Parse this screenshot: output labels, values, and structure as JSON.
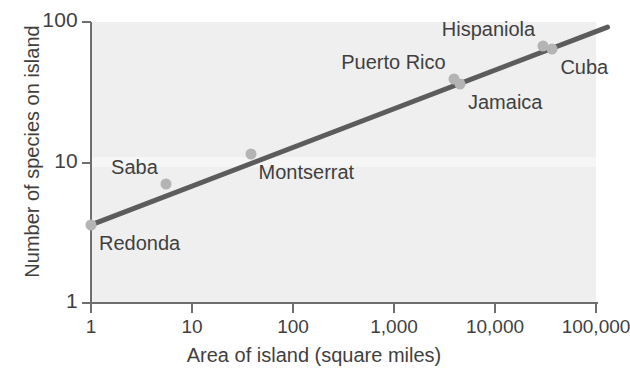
{
  "chart_data": {
    "type": "scatter",
    "title": "",
    "subtitle": "",
    "xlabel": "Area of island (square miles)",
    "ylabel": "Number of species on island",
    "xscale": "log",
    "yscale": "log",
    "xlim": [
      1,
      100000
    ],
    "ylim": [
      1,
      100
    ],
    "grid": false,
    "legend_position": "none",
    "xticks": [
      {
        "value": 1,
        "label": "1"
      },
      {
        "value": 10,
        "label": "10"
      },
      {
        "value": 100,
        "label": "100"
      },
      {
        "value": 1000,
        "label": "1,000"
      },
      {
        "value": 10000,
        "label": "10,000"
      },
      {
        "value": 100000,
        "label": "100,000"
      }
    ],
    "yticks": [
      {
        "value": 1,
        "label": "1"
      },
      {
        "value": 10,
        "label": "10"
      },
      {
        "value": 100,
        "label": "100"
      }
    ],
    "series": [
      {
        "name": "Caribbean islands",
        "marker_color": "#b4b4b4",
        "points": [
          {
            "label": "Redonda",
            "x": 1,
            "y": 3.6,
            "label_pos": "below-right"
          },
          {
            "label": "Saba",
            "x": 5.5,
            "y": 7.0,
            "label_pos": "above-left"
          },
          {
            "label": "Montserrat",
            "x": 38,
            "y": 11.5,
            "label_pos": "below-right"
          },
          {
            "label": "Puerto Rico",
            "x": 3900,
            "y": 39,
            "label_pos": "above-left"
          },
          {
            "label": "Jamaica",
            "x": 4500,
            "y": 36,
            "label_pos": "below-right"
          },
          {
            "label": "Hispaniola",
            "x": 30000,
            "y": 68,
            "label_pos": "above-left"
          },
          {
            "label": "Cuba",
            "x": 37000,
            "y": 64,
            "label_pos": "below-right"
          }
        ]
      }
    ],
    "trendline": {
      "name": "species-area regression",
      "color": "#5c5c5c",
      "x_start": 1,
      "y_start": 3.6,
      "x_end": 130000,
      "y_end": 92,
      "width_px": 5
    },
    "annotation_colors": {
      "plot_background": "#efefef",
      "axis": "#6e6e6e",
      "text": "#3f3f3f",
      "marker": "#b4b4b4",
      "line": "#5c5c5c"
    }
  }
}
